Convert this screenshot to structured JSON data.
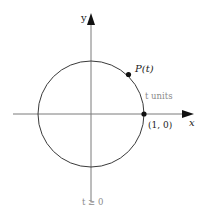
{
  "diagram": {
    "type": "unit-circle",
    "colors": {
      "axis": "#7a7a7a",
      "circle": "#3a3a3a",
      "point": "#111111",
      "text_dark": "#222222",
      "text_gray": "#8a8a8a"
    },
    "labels": {
      "y_axis": "y",
      "x_axis": "x",
      "point_p": "P(t)",
      "arc_length": "t units",
      "start_point": "(1, 0)",
      "condition": "t ≥ 0"
    }
  }
}
